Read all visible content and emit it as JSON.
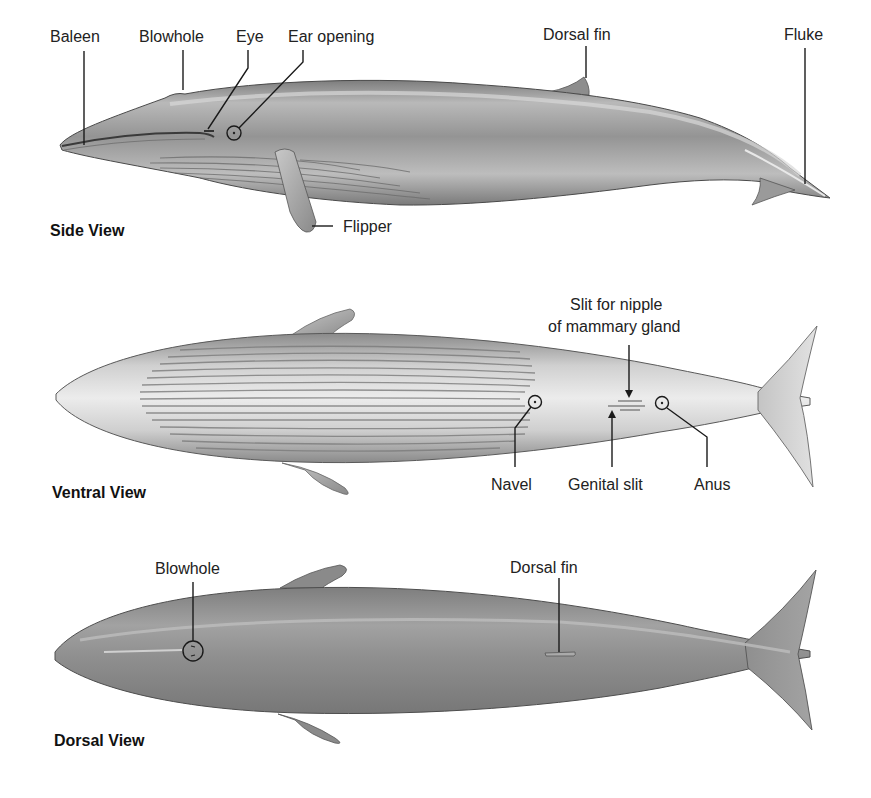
{
  "diagram": {
    "colors": {
      "background": "#ffffff",
      "body_dark": "#8c8c8c",
      "body_mid": "#a9a9a9",
      "body_light": "#e6e6e6",
      "line": "#1a1a1a",
      "text": "#222222"
    },
    "views": [
      {
        "id": "side",
        "title": "Side View",
        "labels": {
          "baleen": "Baleen",
          "blowhole": "Blowhole",
          "eye": "Eye",
          "ear_opening": "Ear opening",
          "dorsal_fin": "Dorsal fin",
          "fluke": "Fluke",
          "flipper": "Flipper"
        }
      },
      {
        "id": "ventral",
        "title": "Ventral View",
        "labels": {
          "slit_line1": "Slit for nipple",
          "slit_line2": "of mammary gland",
          "navel": "Navel",
          "genital_slit": "Genital slit",
          "anus": "Anus"
        }
      },
      {
        "id": "dorsal",
        "title": "Dorsal View",
        "labels": {
          "blowhole": "Blowhole",
          "dorsal_fin": "Dorsal fin"
        }
      }
    ]
  }
}
